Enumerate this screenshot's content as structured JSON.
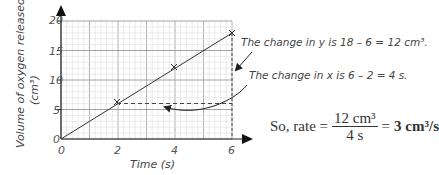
{
  "chart_data": {
    "type": "line",
    "title": "",
    "xlabel": "Time (s)",
    "ylabel": "Volume of oxygen released",
    "ylabel_unit": "(cm³)",
    "xlim": [
      0,
      6
    ],
    "ylim": [
      0,
      20
    ],
    "x_ticks": [
      "0",
      "2",
      "4",
      "6"
    ],
    "y_ticks": [
      "0",
      "5",
      "10",
      "15",
      "20"
    ],
    "grid": true,
    "series": [
      {
        "name": "oxygen released",
        "x": [
          0,
          2,
          4,
          6
        ],
        "y": [
          0,
          6,
          12,
          18
        ],
        "marked_points": [
          [
            2,
            6
          ],
          [
            4,
            12
          ],
          [
            6,
            18
          ]
        ]
      }
    ],
    "annotations": [
      "The change in y is 18 – 6 = 12 cm³.",
      "The change in x is 6 – 2 = 4 s."
    ]
  },
  "labels": {
    "x_axis": "Time (s)",
    "y_axis_line1": "Volume of oxygen released",
    "y_axis_line2": "(cm³)",
    "tick_x0": "0",
    "tick_x2": "2",
    "tick_x4": "4",
    "tick_x6": "6",
    "tick_y0": "0",
    "tick_y5": "5",
    "tick_y10": "10",
    "tick_y15": "15",
    "tick_y20": "20"
  },
  "annotations": {
    "change_y": "The change in y is 18 – 6 = 12 cm³.",
    "change_x": "The change in x is 6 – 2 = 4 s."
  },
  "rate": {
    "prefix": "So, rate =",
    "numerator": "12 cm³",
    "denominator": "4 s",
    "equals": "=",
    "result": "3 cm³/s"
  }
}
